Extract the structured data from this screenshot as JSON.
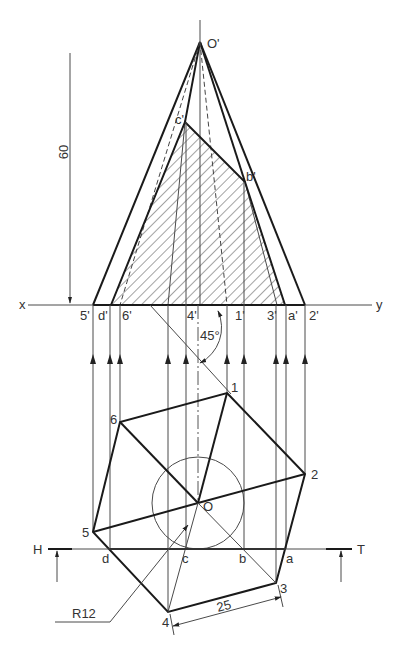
{
  "labels": {
    "apex_front": "O'",
    "x": "x",
    "y": "y",
    "section_front": {
      "c": "c'",
      "b": "b'",
      "d": "d'",
      "a": "a'"
    },
    "base_front": {
      "p5": "5'",
      "p6": "6'",
      "p4": "4'",
      "p1": "1'",
      "p3": "3'",
      "p2": "2'"
    },
    "top": {
      "p1": "1",
      "p2": "2",
      "p3": "3",
      "p4": "4",
      "p5": "5",
      "p6": "6",
      "center": "O"
    },
    "section_top": {
      "a": "a",
      "b": "b",
      "c": "c",
      "d": "d"
    },
    "plane_H": "H",
    "plane_T": "T"
  },
  "dimensions": {
    "height": "60",
    "side": "25",
    "radius": "R12",
    "angle": "45°"
  },
  "colors": {
    "line": "#1a1a1a",
    "thin_line": "#4a4a4a",
    "text": "#333333",
    "background": "#ffffff"
  }
}
